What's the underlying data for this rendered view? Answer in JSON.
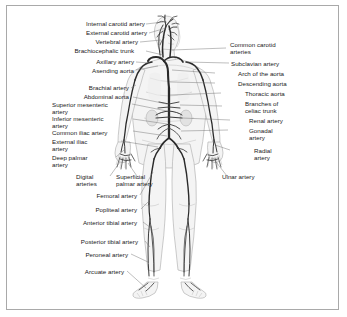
{
  "figure": {
    "border_color": "#a9a9a9",
    "background_color": "#ffffff",
    "vessel_color": "#2a2a2a",
    "body_fill_color": "#f4f4f4",
    "leader_color": "#6e6e6e"
  },
  "labels_left": [
    {
      "id": "internal-carotid-artery",
      "text": "Internal carotid artery"
    },
    {
      "id": "external-carotid-artery",
      "text": "External carotid artery"
    },
    {
      "id": "vertebral-artery",
      "text": "Vertebral artery"
    },
    {
      "id": "brachiocephalic-trunk",
      "text": "Brachiocephalic trunk"
    },
    {
      "id": "axillary-artery",
      "text": "Axillary artery"
    },
    {
      "id": "asending-aorta",
      "text": "Asending aorta"
    },
    {
      "id": "brachial-artery",
      "text": "Brachial artery"
    },
    {
      "id": "abdominal-aorta",
      "text": "Abdominal aorta"
    },
    {
      "id": "superior-mesenteric-artery",
      "text": "Superior mesenteric\nartery"
    },
    {
      "id": "inferior-mesenteric-artery",
      "text": "Inferior mesenteric\nartery"
    },
    {
      "id": "common-iliac-artery",
      "text": "Common iliac artery"
    },
    {
      "id": "external-iliac-artery",
      "text": "External iliac\nartery"
    },
    {
      "id": "deep-palmar-artery",
      "text": "Deep palmar\nartery"
    },
    {
      "id": "digital-arteries",
      "text": "Digital\narteries"
    },
    {
      "id": "superficial-palmar-artery",
      "text": "Superficial\npalmar artery"
    },
    {
      "id": "femoral-artery",
      "text": "Femoral artery"
    },
    {
      "id": "popliteal-artery",
      "text": "Popliteal artery"
    },
    {
      "id": "anterior-tibial-artery",
      "text": "Anterior tibial artery"
    },
    {
      "id": "posterior-tibial-artery",
      "text": "Posterior tibial artery"
    },
    {
      "id": "peroneal-artery",
      "text": "Peroneal artery"
    },
    {
      "id": "arcuate-artery",
      "text": "Arcuate artery"
    }
  ],
  "labels_right": [
    {
      "id": "common-carotid-arteries",
      "text": "Common carotid\narteries"
    },
    {
      "id": "subclavian-artery",
      "text": "Subclavian artery"
    },
    {
      "id": "arch-of-the-aorta",
      "text": "Arch of the aorta"
    },
    {
      "id": "descending-aorta",
      "text": "Descending aorta"
    },
    {
      "id": "thoracic-aorta",
      "text": "Thoracic aorta"
    },
    {
      "id": "branches-of-celiac-trunk",
      "text": "Branches of\nceliac trunk"
    },
    {
      "id": "renal-artery",
      "text": "Renal artery"
    },
    {
      "id": "gonadal-artery",
      "text": "Gonadal\nartery"
    },
    {
      "id": "radial-artery",
      "text": "Radial\nartery"
    },
    {
      "id": "ulnar-artery",
      "text": "Ulnar artery"
    }
  ]
}
